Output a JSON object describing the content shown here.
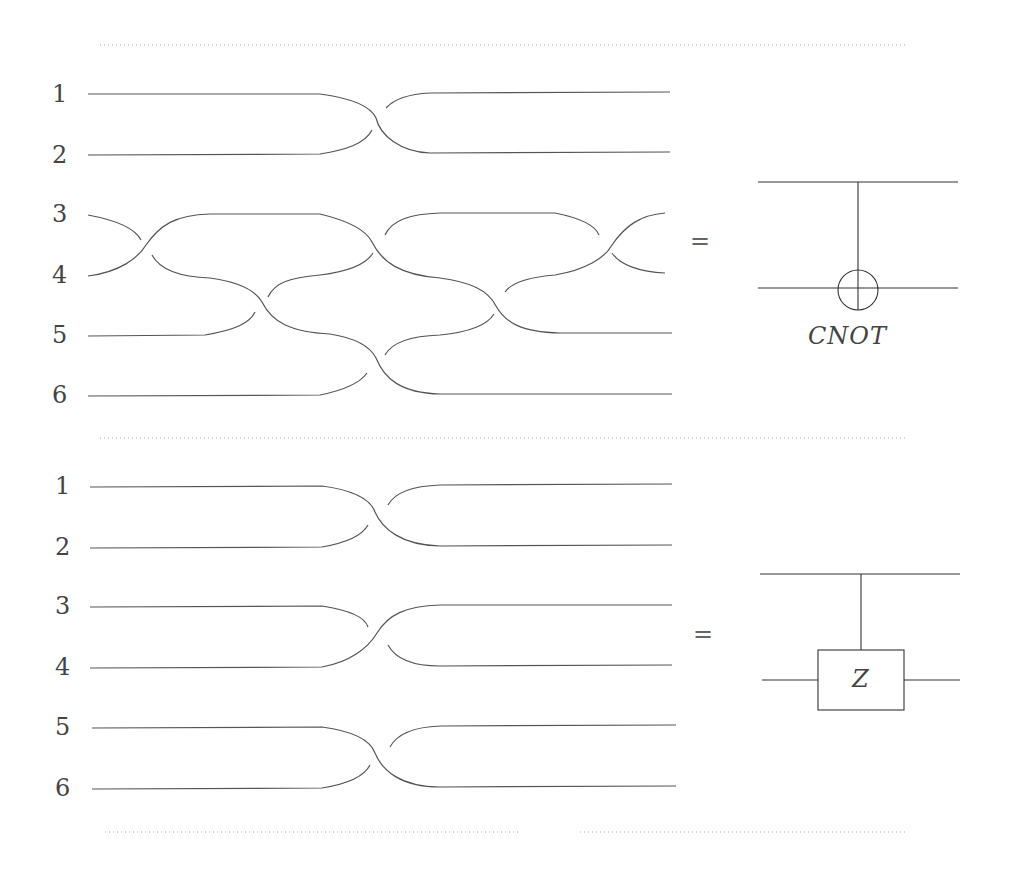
{
  "top": {
    "strand_labels": [
      "1",
      "2",
      "3",
      "4",
      "5",
      "6"
    ],
    "equals": "=",
    "gate_label": "CNOT"
  },
  "bottom": {
    "strand_labels": [
      "1",
      "2",
      "3",
      "4",
      "5",
      "6"
    ],
    "equals": "=",
    "gate_label": "Z"
  }
}
